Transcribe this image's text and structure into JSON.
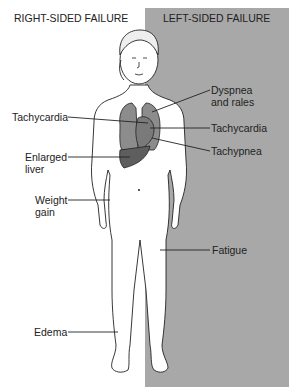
{
  "headers": {
    "right": "RIGHT-SIDED FAILURE",
    "left": "LEFT-SIDED FAILURE"
  },
  "labels_right": {
    "tachycardia": "Tachycardia",
    "enlarged_liver_1": "Enlarged",
    "enlarged_liver_2": "liver",
    "weight_gain_1": "Weight",
    "weight_gain_2": "gain",
    "edema": "Edema"
  },
  "labels_left": {
    "dyspnea_1": "Dyspnea",
    "dyspnea_2": "and rales",
    "tachycardia": "Tachycardia",
    "tachypnea": "Tachypnea",
    "fatigue": "Fatigue"
  },
  "colors": {
    "left_panel": "#a8a8a8",
    "lungs": "#8c8c8c",
    "liver": "#5e5e5e"
  }
}
